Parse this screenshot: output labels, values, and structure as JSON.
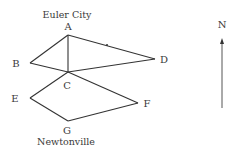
{
  "diagram": {
    "type": "graph",
    "cities": {
      "top": {
        "label": "Euler City",
        "x": 67,
        "y": 18
      },
      "bottom": {
        "label": "Newtonville",
        "x": 66,
        "y": 145
      }
    },
    "nodes": [
      {
        "id": "A",
        "label": "A",
        "x": 68,
        "y": 35,
        "lx": 68,
        "ly": 30
      },
      {
        "id": "B",
        "label": "B",
        "x": 30,
        "y": 63,
        "lx": 16,
        "ly": 67
      },
      {
        "id": "C",
        "label": "C",
        "x": 68,
        "y": 72,
        "lx": 67,
        "ly": 89
      },
      {
        "id": "D",
        "label": "D",
        "x": 155,
        "y": 59,
        "lx": 164,
        "ly": 63
      },
      {
        "id": "E",
        "label": "E",
        "x": 30,
        "y": 98,
        "lx": 15,
        "ly": 102
      },
      {
        "id": "F",
        "label": "F",
        "x": 138,
        "y": 103,
        "lx": 147,
        "ly": 107
      },
      {
        "id": "G",
        "label": "G",
        "x": 68,
        "y": 121,
        "lx": 67,
        "ly": 134
      }
    ],
    "edges": [
      [
        "A",
        "B"
      ],
      [
        "A",
        "C"
      ],
      [
        "A",
        "D"
      ],
      [
        "B",
        "C"
      ],
      [
        "C",
        "D"
      ],
      [
        "C",
        "E"
      ],
      [
        "C",
        "F"
      ],
      [
        "E",
        "G"
      ],
      [
        "G",
        "F"
      ]
    ],
    "compass": {
      "label": "N",
      "x": 222,
      "y_top": 38,
      "y_bottom": 108,
      "label_y": 28
    }
  }
}
